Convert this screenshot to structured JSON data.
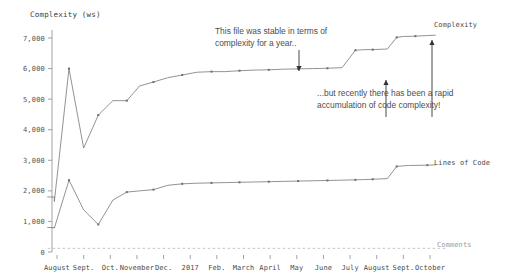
{
  "chart_data": {
    "type": "line",
    "title": "",
    "ylabel": "Complexity (ws)",
    "xlabel": "",
    "ylim": [
      0,
      7400
    ],
    "yticks": [
      "0",
      "1,000",
      "2,000",
      "3,000",
      "4,000",
      "5,000",
      "6,000",
      "7,000"
    ],
    "ytick_values": [
      0,
      1000,
      2000,
      3000,
      4000,
      5000,
      6000,
      7000
    ],
    "grid": false,
    "legend_position": "right-inline",
    "categories": [
      "August",
      "Sept.",
      "Oct.",
      "November",
      "Dec.",
      "2017",
      "Feb.",
      "March",
      "April",
      "May",
      "June",
      "July",
      "August",
      "Sept.",
      "October"
    ],
    "x": [
      0,
      1,
      2,
      3,
      4,
      5,
      6,
      7,
      8,
      9,
      10,
      11,
      12,
      13,
      14
    ],
    "series": [
      {
        "name": "Complexity",
        "style": "solid",
        "color": "#777777",
        "x": [
          -0.35,
          -0.1,
          -0.1,
          0.45,
          1.0,
          1.55,
          2.1,
          2.62,
          3.1,
          3.62,
          4.15,
          4.7,
          5.25,
          5.8,
          6.3,
          6.85,
          7.4,
          7.95,
          8.5,
          9.05,
          9.6,
          10.15,
          10.7,
          11.2,
          11.55,
          11.85,
          12.4,
          12.75,
          13.0,
          13.45,
          13.9,
          14.2
        ],
        "values": [
          1800,
          1800,
          1650,
          6000,
          3400,
          4480,
          4950,
          4950,
          5430,
          5560,
          5700,
          5790,
          5880,
          5900,
          5900,
          5930,
          5950,
          5960,
          5980,
          5990,
          6000,
          6010,
          6030,
          6600,
          6620,
          6620,
          6640,
          7020,
          7050,
          7060,
          7080,
          7090
        ]
      },
      {
        "name": "Lines of Code",
        "style": "solid",
        "color": "#777777",
        "x": [
          -0.35,
          -0.1,
          -0.1,
          0.45,
          1.0,
          1.55,
          2.1,
          2.62,
          3.1,
          3.62,
          4.15,
          4.7,
          5.25,
          5.8,
          6.3,
          6.85,
          7.4,
          7.95,
          8.5,
          9.05,
          9.6,
          10.15,
          10.7,
          11.2,
          11.55,
          11.85,
          12.4,
          12.75,
          13.2,
          13.9,
          14.2
        ],
        "values": [
          800,
          800,
          780,
          2350,
          1380,
          900,
          1700,
          1960,
          2000,
          2040,
          2180,
          2230,
          2250,
          2260,
          2270,
          2280,
          2290,
          2300,
          2310,
          2320,
          2330,
          2340,
          2350,
          2360,
          2370,
          2380,
          2400,
          2800,
          2830,
          2840,
          2850
        ]
      },
      {
        "name": "Comments",
        "style": "dashed",
        "color": "#b5b5b5",
        "x": [
          -0.35,
          14.6
        ],
        "values": [
          120,
          120
        ]
      }
    ],
    "annotations": [
      {
        "id": "stable",
        "text": "This file was stable in terms of\ncomplexity for a year..",
        "points_to": "complexity-plateau"
      },
      {
        "id": "rapid",
        "text": "...but recently there has been a rapid\naccumulation of code complexity!",
        "points_to": "complexity-final-rise"
      }
    ]
  },
  "labels": {
    "complexity_series": "Complexity",
    "lines_of_code_series": "Lines of Code",
    "comments_series": "Comments",
    "y_axis_title": "Complexity (ws)"
  }
}
